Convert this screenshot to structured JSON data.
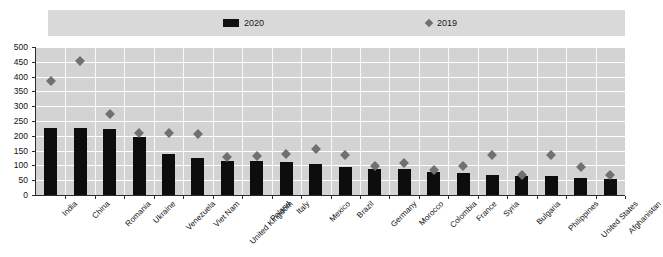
{
  "legend": {
    "entries": [
      {
        "label": "2020",
        "marker": "bar-swatch",
        "color": "#111111"
      },
      {
        "label": "2019",
        "marker": "diamond-swatch",
        "color": "#6f6f6f"
      }
    ]
  },
  "axis": {
    "y_ticks": [
      "500",
      "450",
      "400",
      "350",
      "300",
      "250",
      "200",
      "150",
      "100",
      "50",
      "0"
    ]
  },
  "colors": {
    "bar": "#0d0d0d",
    "marker": "#707070",
    "plot_background": "#d3d3d3",
    "legend_background": "#d9d9d9",
    "gridline": "#ffffff",
    "axis": "#2b2b2b"
  },
  "chart_data": {
    "type": "bar",
    "title": "",
    "subtitle": "",
    "xlabel": "",
    "ylabel": "",
    "ylim": [
      0,
      500
    ],
    "ytick_step": 50,
    "grid": true,
    "legend_position": "top",
    "categories": [
      "India",
      "China",
      "Romania",
      "Ukraine",
      "Venezuela",
      "Viet Nam",
      "United Kingdom",
      "Poland",
      "Italy",
      "Mexico",
      "Brazil",
      "Germany",
      "Morocco",
      "Colombia",
      "France",
      "Syria",
      "Bulgaria",
      "Philippines",
      "United States",
      "Afghanistan"
    ],
    "series": [
      {
        "name": "2020",
        "type": "bar",
        "color": "#0d0d0d",
        "values": [
          228,
          228,
          222,
          195,
          137,
          125,
          116,
          114,
          110,
          104,
          95,
          88,
          87,
          78,
          75,
          69,
          65,
          63,
          57,
          55
        ]
      },
      {
        "name": "2019",
        "type": "scatter",
        "marker": "diamond",
        "color": "#707070",
        "values": [
          396,
          463,
          287,
          222,
          221,
          219,
          139,
          142,
          152,
          167,
          147,
          110,
          121,
          95,
          109,
          146,
          78,
          147,
          107,
          80
        ]
      }
    ]
  }
}
